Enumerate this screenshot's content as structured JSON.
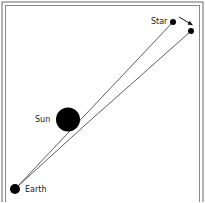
{
  "diagram": {
    "labels": {
      "star": "Star",
      "sun": "Sun",
      "earth": "Earth"
    },
    "colors": {
      "ink": "#111111",
      "frame": "#555555",
      "background": "#ffffff"
    }
  }
}
